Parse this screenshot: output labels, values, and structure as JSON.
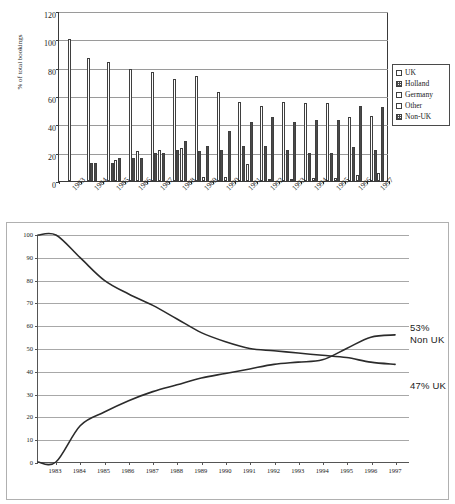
{
  "chart_data": [
    {
      "type": "bar",
      "title": "",
      "xlabel": "",
      "ylabel": "% of total bookings",
      "ylim": [
        0,
        120
      ],
      "ytick_step": 20,
      "yticks": [
        0,
        20,
        40,
        60,
        80,
        100,
        120
      ],
      "grid": true,
      "legend_position": "right",
      "categories": [
        "1983",
        "1984",
        "1985",
        "1986",
        "1987",
        "1988",
        "1989",
        "1990",
        "1991",
        "1992",
        "1993",
        "1994",
        "1995",
        "1996",
        "1997"
      ],
      "series": [
        {
          "name": "UK",
          "fill": "white",
          "values": [
            100,
            87,
            84,
            79,
            77,
            72,
            74,
            63,
            56,
            53,
            56,
            55,
            55,
            45,
            46
          ]
        },
        {
          "name": "Holland",
          "fill": "hatched",
          "values": [
            0,
            13,
            13,
            16,
            20,
            22,
            21,
            22,
            25,
            25,
            22,
            20,
            20,
            24,
            22
          ]
        },
        {
          "name": "Germany",
          "fill": "white",
          "values": [
            0,
            0,
            15,
            0,
            22,
            23,
            0,
            0,
            0,
            0,
            0,
            0,
            0,
            0,
            0
          ]
        },
        {
          "name": "Other",
          "fill": "white",
          "values": [
            0,
            0,
            0,
            21,
            0,
            0,
            3,
            3,
            12,
            1,
            1,
            2,
            2,
            4,
            6
          ]
        },
        {
          "name": "Non-UK",
          "fill": "hatched",
          "values": [
            0,
            13,
            16,
            16,
            20,
            28,
            25,
            35,
            42,
            45,
            42,
            43,
            43,
            53,
            52
          ]
        }
      ]
    },
    {
      "type": "line",
      "title": "",
      "xlabel": "",
      "ylabel": "",
      "ylim": [
        0,
        100
      ],
      "ytick_step": 10,
      "yticks": [
        0,
        10,
        20,
        30,
        40,
        50,
        60,
        70,
        80,
        90,
        100
      ],
      "grid": true,
      "legend_position": "inline-annotation",
      "x": [
        "1983",
        "1984",
        "1985",
        "1986",
        "1987",
        "1988",
        "1989",
        "1990",
        "1991",
        "1992",
        "1993",
        "1994",
        "1995",
        "1996",
        "1997"
      ],
      "series": [
        {
          "name": "UK",
          "end_label": "47% UK",
          "values": [
            100,
            90,
            80,
            74,
            69,
            63,
            57,
            53,
            50,
            49,
            48,
            47,
            46,
            44,
            43
          ]
        },
        {
          "name": "Non UK",
          "end_label": "53% Non UK",
          "values": [
            0,
            16,
            22,
            27,
            31,
            34,
            37,
            39,
            41,
            43,
            44,
            45,
            50,
            55,
            56
          ]
        }
      ],
      "annotations": [
        {
          "name": "non-uk-endpoint",
          "line1": "53%",
          "line2": "Non UK"
        },
        {
          "name": "uk-endpoint",
          "line1": "47% UK"
        }
      ]
    }
  ],
  "barchart": {
    "ylabel": "% of total bookings",
    "yticks": [
      "0",
      "20",
      "40",
      "60",
      "80",
      "100",
      "120"
    ],
    "xlabels": [
      "1983",
      "1984",
      "1985",
      "1986",
      "1987",
      "1988",
      "1989",
      "1990",
      "1991",
      "1992",
      "1993",
      "1994",
      "1995",
      "1996",
      "1997"
    ],
    "legend": [
      {
        "label": "UK",
        "swatch": "white"
      },
      {
        "label": "Holland",
        "swatch": "hatched"
      },
      {
        "label": "Germany",
        "swatch": "white"
      },
      {
        "label": "Other",
        "swatch": "white"
      },
      {
        "label": "Non-UK",
        "swatch": "hatched"
      }
    ]
  },
  "linechart": {
    "yticks": [
      "0",
      "10",
      "20",
      "30",
      "40",
      "50",
      "60",
      "70",
      "80",
      "90",
      "100"
    ],
    "xlabels": [
      "1983",
      "1984",
      "1985",
      "1986",
      "1987",
      "1988",
      "1989",
      "1990",
      "1991",
      "1992",
      "1993",
      "1994",
      "1995",
      "1996",
      "1997"
    ],
    "annot_nonuk_pct": "53%",
    "annot_nonuk_name": "Non UK",
    "annot_uk": "47% UK"
  },
  "colors": {
    "axis": "#3a3a3a",
    "grid": "#9a9a9a",
    "line": "#2b2b2b",
    "bar_outline": "#3f3f3f",
    "hatch": "#4a4a4a",
    "panel_border": "#b0b0b0"
  }
}
